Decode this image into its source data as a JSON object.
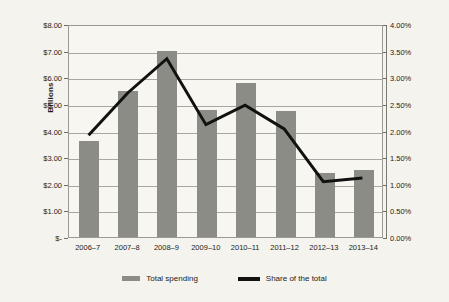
{
  "chart_data": {
    "type": "bar",
    "title": "",
    "xlabel": "",
    "ylabel": "Billions",
    "y2label": "",
    "categories": [
      "2006–7",
      "2007–8",
      "2008–9",
      "2009–10",
      "2010–11",
      "2011–12",
      "2012–13",
      "2013–14"
    ],
    "series": [
      {
        "name": "Total spending",
        "type": "bar",
        "axis": "left",
        "color": "#8c8c87",
        "values": [
          3.6,
          5.5,
          7.0,
          4.78,
          5.8,
          4.75,
          2.4,
          2.52
        ]
      },
      {
        "name": "Share of the total",
        "type": "line",
        "axis": "right",
        "color": "#111110",
        "values": [
          1.93,
          2.73,
          3.38,
          2.13,
          2.5,
          2.05,
          1.05,
          1.12
        ]
      }
    ],
    "ylim": [
      0,
      8
    ],
    "y2lim": [
      0,
      4
    ],
    "y_ticks": [
      0,
      1,
      2,
      3,
      4,
      5,
      6,
      7,
      8
    ],
    "y_tick_labels": [
      "$-",
      "$1.00",
      "$2.00",
      "$3.00",
      "$4.00",
      "$5.00",
      "$6.00",
      "$7.00",
      "$8.00"
    ],
    "y2_ticks": [
      0,
      0.5,
      1.0,
      1.5,
      2.0,
      2.5,
      3.0,
      3.5,
      4.0
    ],
    "y2_tick_labels": [
      "0.00%",
      "0.50%",
      "1.00%",
      "1.50%",
      "2.00%",
      "2.50%",
      "3.00%",
      "3.50%",
      "4.00%"
    ],
    "grid": true,
    "legend_position": "bottom",
    "legend": [
      "Total spending",
      "Share of the total"
    ]
  },
  "colors": {
    "background": "#f4f3ed",
    "plot_background": "#f7f6f0",
    "bar": "#8c8c87",
    "line": "#111110",
    "grid": "#a8a8a0",
    "axis": "#9a9a93",
    "text": "#1c1c1a"
  }
}
